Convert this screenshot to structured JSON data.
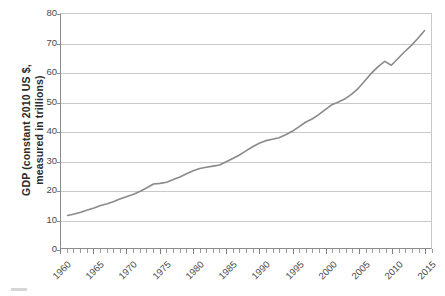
{
  "chart_data": {
    "type": "line",
    "title": "",
    "xlabel": "",
    "ylabel": "GDP (constant 2010 US $, measured in trillions)",
    "ylabel_line1": "GDP (constant 2010 US $,",
    "ylabel_line2": "measured in trillions)",
    "xlim": [
      1960,
      2016
    ],
    "ylim": [
      0,
      80
    ],
    "y_ticks": [
      0,
      10,
      20,
      30,
      40,
      50,
      60,
      70,
      80
    ],
    "y_tick_labels": [
      "0",
      "10",
      "20",
      "30",
      "40",
      "50",
      "60",
      "70",
      "80"
    ],
    "x_ticks": [
      1960,
      1965,
      1970,
      1975,
      1980,
      1985,
      1990,
      1995,
      2000,
      2005,
      2010,
      2015
    ],
    "x_tick_labels": [
      "1960",
      "1965",
      "1970",
      "1975",
      "1980",
      "1985",
      "1990",
      "1995",
      "2000",
      "2005",
      "2010",
      "2015"
    ],
    "x_minor_tick_interval": 1,
    "grid": "horizontal",
    "legend": "none",
    "line_color": "#8a8a8a",
    "line_width": 1.6,
    "series": [
      {
        "name": "World GDP",
        "x": [
          1961,
          1962,
          1963,
          1964,
          1965,
          1966,
          1967,
          1968,
          1969,
          1970,
          1971,
          1972,
          1973,
          1974,
          1975,
          1976,
          1977,
          1978,
          1979,
          1980,
          1981,
          1982,
          1983,
          1984,
          1985,
          1986,
          1987,
          1988,
          1989,
          1990,
          1991,
          1992,
          1993,
          1994,
          1995,
          1996,
          1997,
          1998,
          1999,
          2000,
          2001,
          2002,
          2003,
          2004,
          2005,
          2006,
          2007,
          2008,
          2009,
          2010,
          2011,
          2012,
          2013,
          2014,
          2015
        ],
        "y": [
          11.1,
          11.6,
          12.2,
          13.0,
          13.7,
          14.5,
          15.1,
          15.9,
          16.8,
          17.6,
          18.4,
          19.4,
          20.6,
          21.9,
          22.1,
          22.5,
          23.4,
          24.3,
          25.4,
          26.4,
          27.2,
          27.6,
          28.0,
          28.4,
          29.5,
          30.6,
          31.8,
          33.2,
          34.6,
          35.8,
          36.7,
          37.2,
          37.7,
          38.7,
          39.9,
          41.4,
          43.0,
          44.1,
          45.6,
          47.3,
          49.0,
          49.9,
          51.0,
          52.6,
          54.6,
          57.2,
          59.8,
          62.0,
          63.8,
          62.5,
          64.8,
          67.1,
          69.2,
          71.6,
          74.3
        ]
      }
    ]
  },
  "artifact": {
    "name": "stray-mark"
  }
}
